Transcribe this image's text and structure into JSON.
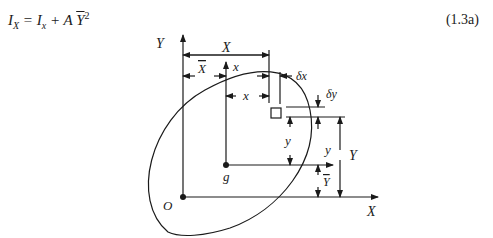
{
  "equation": {
    "lhs_symbol": "I",
    "lhs_sub": "X",
    "equals": " = ",
    "term1_symbol": "I",
    "term1_sub": "x",
    "plus": " + A ",
    "ybar": "Y",
    "exponent": "2",
    "number": "(1.3a)"
  },
  "diagram": {
    "labels": {
      "axis_Y": "Y",
      "axis_X": "X",
      "origin": "O",
      "centroid": "g",
      "dim_X": "X",
      "dim_Xbar": "X",
      "local_x_axis": "x",
      "dim_x": "x",
      "dim_dx": "δx",
      "dim_dy": "δy",
      "dim_y": "y",
      "local_y_axis": "y",
      "dim_Y": "Y",
      "dim_Ybar": "Y"
    }
  }
}
